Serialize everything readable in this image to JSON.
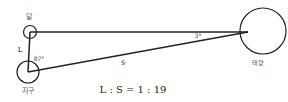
{
  "diagram": {
    "bodies": {
      "moon": {
        "label": "달"
      },
      "earth": {
        "label": "지구"
      },
      "sun": {
        "label": "태양"
      }
    },
    "segments": {
      "earth_moon": {
        "label": "L"
      },
      "earth_sun": {
        "label": "S"
      }
    },
    "angles": {
      "earth_angle": "87°",
      "sun_angle": "3°"
    },
    "ratio": "L : S = 1 : 19",
    "colors": {
      "stroke": "#222222",
      "text": "#333333"
    }
  }
}
